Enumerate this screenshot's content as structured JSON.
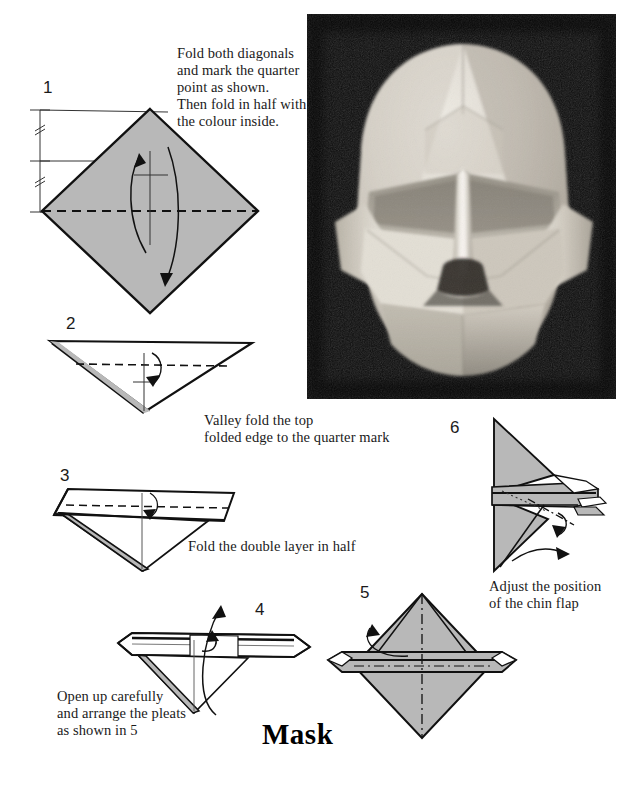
{
  "page": {
    "title": "Mask",
    "background_color": "#ffffff",
    "paper_fill_color": "#b8b8b8",
    "ink_color": "#111111"
  },
  "photo": {
    "name": "finished-origami-mask-photograph",
    "subject": "folded paper mask resembling a human face",
    "background_color": "#0d0d0d",
    "paper_color": "#d9d4cb",
    "x": 307,
    "y": 14,
    "width": 309,
    "height": 385
  },
  "steps": [
    {
      "number": "1",
      "caption": "Fold both diagonals\nand mark the quarter\npoint as shown.\nThen fold in half with\nthe colour inside.",
      "caption_x": 177,
      "caption_y": 45,
      "num_x": 43,
      "num_y": 78
    },
    {
      "number": "2",
      "caption": "Valley fold the top\nfolded edge to the quarter mark",
      "caption_x": 204,
      "caption_y": 412,
      "num_x": 66,
      "num_y": 314
    },
    {
      "number": "3",
      "caption": "Fold the double layer in half",
      "caption_x": 188,
      "caption_y": 538,
      "num_x": 60,
      "num_y": 466
    },
    {
      "number": "4",
      "caption": "Open up carefully\nand arrange the pleats\nas shown in 5",
      "caption_x": 57,
      "caption_y": 688,
      "num_x": 255,
      "num_y": 600
    },
    {
      "number": "5",
      "caption": "",
      "caption_x": 0,
      "caption_y": 0,
      "num_x": 360,
      "num_y": 583
    },
    {
      "number": "6",
      "caption": "Adjust the position\nof the chin flap",
      "caption_x": 489,
      "caption_y": 578,
      "num_x": 450,
      "num_y": 418
    }
  ],
  "title_pos": {
    "x": 262,
    "y": 720
  }
}
